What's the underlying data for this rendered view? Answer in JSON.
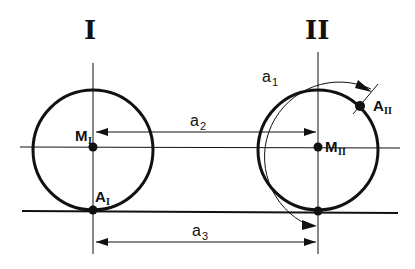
{
  "diagram": {
    "positions": [
      {
        "id": "I",
        "label": "I",
        "center_label": "M",
        "center_sub": "I",
        "contact_label": "A",
        "contact_sub": "I"
      },
      {
        "id": "II",
        "label": "II",
        "center_label": "M",
        "center_sub": "II",
        "point_label": "A",
        "point_sub": "II"
      }
    ],
    "dimensions": {
      "a1": {
        "label": "a",
        "sub": "1",
        "description": "arc length rolled"
      },
      "a2": {
        "label": "a",
        "sub": "2",
        "description": "center displacement"
      },
      "a3": {
        "label": "a",
        "sub": "3",
        "description": "contact point displacement"
      }
    },
    "colors": {
      "stroke": "#111111",
      "background": "#ffffff"
    }
  }
}
